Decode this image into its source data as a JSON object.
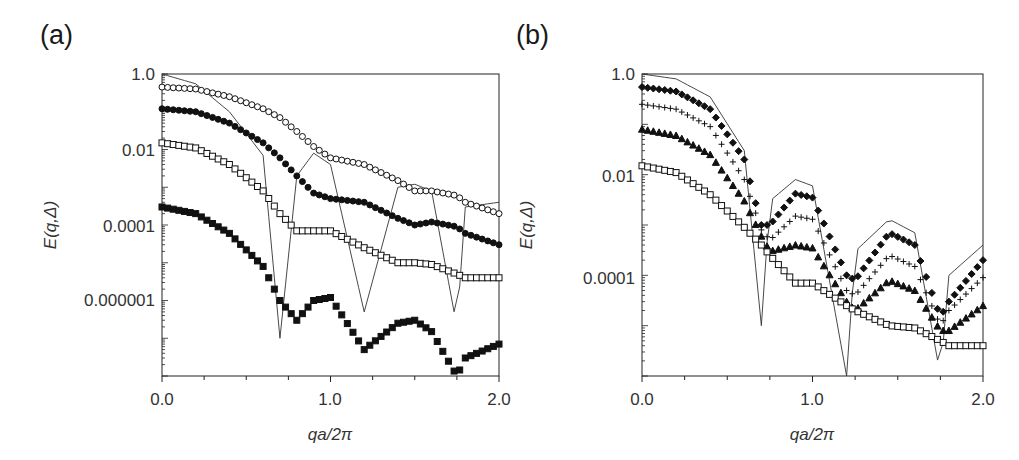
{
  "figure": {
    "panels": [
      {
        "label": "(a)",
        "xlabel": "qa/2π",
        "ylabel": "E(q,Δ)",
        "xticks": [
          "0.0",
          "1.0",
          "2.0"
        ],
        "yticks": [
          "1.0",
          "0.01",
          "0.0001",
          "0.000001"
        ]
      },
      {
        "label": "(b)",
        "xlabel": "qa/2π",
        "ylabel": "E(q,Δ)",
        "xticks": [
          "0.0",
          "1.0",
          "2.0"
        ],
        "yticks": [
          "1.0",
          "0.01",
          "0.0001"
        ]
      }
    ]
  },
  "chart_data": [
    {
      "type": "scatter",
      "title": "(a)",
      "xlabel": "qa/2π",
      "ylabel": "E(q,Δ)",
      "yscale": "log",
      "xlim": [
        0.0,
        2.0
      ],
      "ylim": [
        1e-08,
        1.0
      ],
      "xticks": [
        0.0,
        1.0,
        2.0
      ],
      "yticks": [
        1.0,
        0.01,
        0.0001,
        1e-06
      ],
      "grid": false,
      "legend": null,
      "x": [
        0.0,
        0.2,
        0.4,
        0.6,
        0.7,
        0.8,
        0.9,
        1.0,
        1.2,
        1.4,
        1.5,
        1.6,
        1.75,
        1.8,
        2.0
      ],
      "series": [
        {
          "name": "theory (solid line)",
          "marker": "line",
          "values": [
            1.0,
            0.55,
            0.1,
            0.007,
            1e-07,
            0.002,
            0.008,
            0.004,
            5e-07,
            0.001,
            0.0012,
            0.0008,
            2e-07,
            0.0003,
            0.0004
          ]
        },
        {
          "name": "open circles",
          "marker": "circle-open",
          "values": [
            0.45,
            0.4,
            0.25,
            0.12,
            0.07,
            0.03,
            0.012,
            0.006,
            0.004,
            0.0015,
            0.0008,
            0.0008,
            0.0006,
            0.0004,
            0.0002
          ]
        },
        {
          "name": "filled circles",
          "marker": "circle-filled",
          "values": [
            0.12,
            0.1,
            0.05,
            0.015,
            0.006,
            0.002,
            0.0007,
            0.0005,
            0.0004,
            0.00015,
            0.0001,
            0.00012,
            9e-05,
            6e-05,
            3e-05
          ]
        },
        {
          "name": "open squares",
          "marker": "square-open",
          "values": [
            0.015,
            0.011,
            0.004,
            0.0008,
            0.0002,
            7e-05,
            7e-05,
            7e-05,
            2.5e-05,
            1e-05,
            1e-05,
            9e-06,
            5e-06,
            4e-06,
            4e-06
          ]
        },
        {
          "name": "filled squares",
          "marker": "square-filled",
          "values": [
            0.0003,
            0.0002,
            6e-05,
            8e-06,
            1e-06,
            3e-07,
            1e-06,
            1.2e-06,
            5e-08,
            2.5e-07,
            3e-07,
            1.5e-07,
            1e-08,
            3e-08,
            7e-08
          ]
        }
      ]
    },
    {
      "type": "scatter",
      "title": "(b)",
      "xlabel": "qa/2π",
      "ylabel": "E(q,Δ)",
      "yscale": "log",
      "xlim": [
        0.0,
        2.0
      ],
      "ylim": [
        1e-06,
        1.0
      ],
      "xticks": [
        0.0,
        1.0,
        2.0
      ],
      "yticks": [
        1.0,
        0.01,
        0.0001
      ],
      "grid": false,
      "legend": null,
      "x": [
        0.0,
        0.2,
        0.4,
        0.6,
        0.7,
        0.75,
        0.9,
        1.0,
        1.2,
        1.25,
        1.45,
        1.6,
        1.75,
        1.8,
        2.0
      ],
      "series": [
        {
          "name": "theory (solid line)",
          "marker": "line",
          "values": [
            1.0,
            0.8,
            0.35,
            0.03,
            1e-05,
            0.003,
            0.008,
            0.006,
            1e-06,
            0.0003,
            0.0013,
            0.0007,
            1e-06,
            0.0001,
            0.0004
          ]
        },
        {
          "name": "filled diamonds",
          "marker": "diamond-filled",
          "values": [
            0.55,
            0.45,
            0.2,
            0.02,
            0.001,
            0.001,
            0.0042,
            0.0035,
            0.0001,
            8e-05,
            0.0007,
            0.0004,
            1.5e-05,
            3e-05,
            0.0002
          ]
        },
        {
          "name": "plus",
          "marker": "plus",
          "values": [
            0.25,
            0.2,
            0.09,
            0.008,
            0.0008,
            0.0005,
            0.0015,
            0.0013,
            5e-05,
            4e-05,
            0.00025,
            0.00015,
            1e-05,
            2e-05,
            9e-05
          ]
        },
        {
          "name": "filled triangles",
          "marker": "triangle-filled",
          "values": [
            0.08,
            0.06,
            0.025,
            0.003,
            0.0006,
            0.0003,
            0.0004,
            0.00035,
            3e-05,
            2e-05,
            8e-05,
            5e-05,
            8e-06,
            8e-06,
            2.5e-05
          ]
        },
        {
          "name": "open squares",
          "marker": "square-open",
          "values": [
            0.015,
            0.011,
            0.004,
            0.0009,
            0.0004,
            0.00025,
            7e-05,
            7e-05,
            2.5e-05,
            2e-05,
            1e-05,
            9e-06,
            5e-06,
            4e-06,
            4e-06
          ]
        }
      ]
    }
  ]
}
